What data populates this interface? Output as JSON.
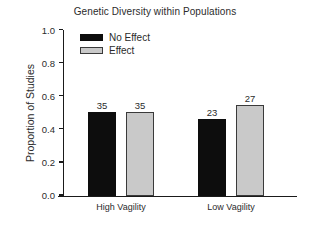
{
  "chart_data": {
    "type": "bar",
    "title": "Genetic Diversity within Populations",
    "xlabel": "",
    "ylabel": "Proportion of Studies",
    "categories": [
      "High Vagility",
      "Low Vagility"
    ],
    "series": [
      {
        "name": "No Effect",
        "color": "#0d0d0d",
        "values": [
          0.5,
          0.46
        ],
        "point_labels": [
          "35",
          "23"
        ]
      },
      {
        "name": "Effect",
        "color": "#c9c9c9",
        "values": [
          0.5,
          0.54
        ],
        "point_labels": [
          "35",
          "27"
        ]
      }
    ],
    "ylim": [
      0.0,
      1.0
    ],
    "yticks": [
      "0.0",
      "0.2",
      "0.4",
      "0.6",
      "0.8",
      "1.0"
    ],
    "ytick_values": [
      0.0,
      0.2,
      0.4,
      0.6,
      0.8,
      1.0
    ],
    "grid": false,
    "legend_position": "top-left"
  }
}
